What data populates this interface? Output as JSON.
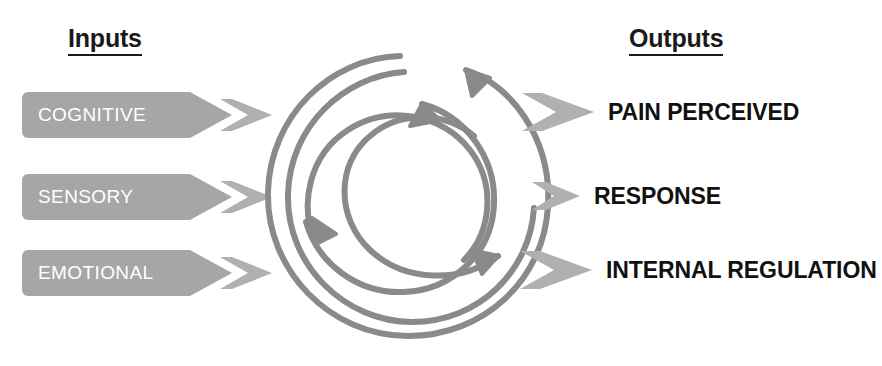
{
  "diagram": {
    "colors": {
      "banner_gray": "#a6a6a6",
      "arrow_gray": "#b0b0b0",
      "stroke_gray": "#8a8a8a",
      "text_black": "#111111",
      "label_white": "#ffffff",
      "background": "#ffffff"
    }
  },
  "headers": {
    "inputs": "Inputs",
    "outputs": "Outputs"
  },
  "inputs": [
    {
      "label": "COGNITIVE",
      "icon": "right-arrow-icon"
    },
    {
      "label": "SENSORY",
      "icon": "right-arrow-icon"
    },
    {
      "label": "EMOTIONAL",
      "icon": "right-arrow-icon"
    }
  ],
  "outputs": [
    {
      "label": "PAIN PERCEIVED",
      "icon": "right-arrow-icon"
    },
    {
      "label": "RESPONSE",
      "icon": "right-arrow-icon"
    },
    {
      "label": "INTERNAL REGULATION",
      "icon": "right-arrow-icon"
    }
  ],
  "central_motif": {
    "name": "interlocking-circular-arrows",
    "description": "Large outer spiral arrow encircling three overlapping circular arrows arranged as a triquetra",
    "arrow_count": 4
  }
}
